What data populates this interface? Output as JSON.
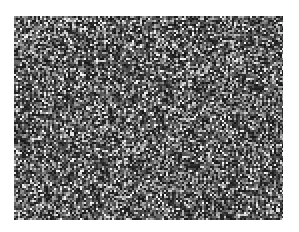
{
  "image": {
    "description": "grayscale random noise texture",
    "canvas": {
      "width": 299,
      "height": 232,
      "background": "#ffffff"
    },
    "texture": {
      "x": 14,
      "y": 16,
      "width": 269,
      "height": 204,
      "base_color": "#3a3a3a",
      "light_color": "#d8d8d8",
      "dark_color": "#111111"
    }
  }
}
